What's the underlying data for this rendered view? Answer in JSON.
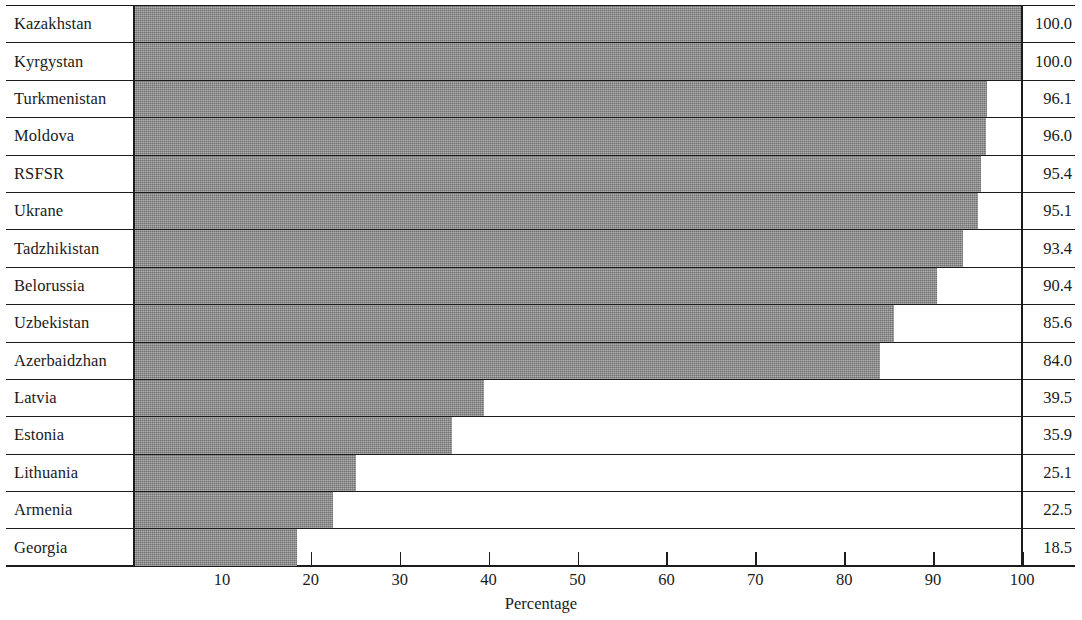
{
  "chart_data": {
    "type": "bar",
    "orientation": "horizontal",
    "title": "",
    "xlabel": "Percentage",
    "ylabel": "",
    "xlim": [
      0,
      105
    ],
    "xticks": [
      10,
      20,
      30,
      40,
      50,
      60,
      70,
      80,
      90,
      100
    ],
    "grid": false,
    "legend": null,
    "value_label_format": "one-decimal",
    "bar_color": "#8c8c8c",
    "axis_color": "#1c1c1c",
    "categories": [
      "Kazakhstan",
      "Kyrgystan",
      "Turkmenistan",
      "Moldova",
      "RSFSR",
      "Ukrane",
      "Tadzhikistan",
      "Belorussia",
      "Uzbekistan",
      "Azerbaidzhan",
      "Latvia",
      "Estonia",
      "Lithuania",
      "Armenia",
      "Georgia"
    ],
    "values": [
      100.0,
      100.0,
      96.1,
      96.0,
      95.4,
      95.1,
      93.4,
      90.4,
      85.6,
      84.0,
      39.5,
      35.9,
      25.1,
      22.5,
      18.5
    ],
    "value_labels": [
      "100.0",
      "100.0",
      "96.1",
      "96.0",
      "95.4",
      "95.1",
      "93.4",
      "90.4",
      "85.6",
      "84.0",
      "39.5",
      "35.9",
      "25.1",
      "22.5",
      "18.5"
    ]
  },
  "rows": [
    {
      "label": "Kazakhstan",
      "value": 100.0,
      "value_label": "100.0"
    },
    {
      "label": "Kyrgystan",
      "value": 100.0,
      "value_label": "100.0"
    },
    {
      "label": "Turkmenistan",
      "value": 96.1,
      "value_label": "96.1"
    },
    {
      "label": "Moldova",
      "value": 96.0,
      "value_label": "96.0"
    },
    {
      "label": "RSFSR",
      "value": 95.4,
      "value_label": "95.4"
    },
    {
      "label": "Ukrane",
      "value": 95.1,
      "value_label": "95.1"
    },
    {
      "label": "Tadzhikistan",
      "value": 93.4,
      "value_label": "93.4"
    },
    {
      "label": "Belorussia",
      "value": 90.4,
      "value_label": "90.4"
    },
    {
      "label": "Uzbekistan",
      "value": 85.6,
      "value_label": "85.6"
    },
    {
      "label": "Azerbaidzhan",
      "value": 84.0,
      "value_label": "84.0"
    },
    {
      "label": "Latvia",
      "value": 39.5,
      "value_label": "39.5"
    },
    {
      "label": "Estonia",
      "value": 35.9,
      "value_label": "35.9"
    },
    {
      "label": "Lithuania",
      "value": 25.1,
      "value_label": "25.1"
    },
    {
      "label": "Armenia",
      "value": 22.5,
      "value_label": "22.5"
    },
    {
      "label": "Georgia",
      "value": 18.5,
      "value_label": "18.5"
    }
  ],
  "axis": {
    "title": "Percentage",
    "ticks": [
      "10",
      "20",
      "30",
      "40",
      "50",
      "60",
      "70",
      "80",
      "90",
      "100"
    ],
    "tick_values": [
      10,
      20,
      30,
      40,
      50,
      60,
      70,
      80,
      90,
      100
    ]
  }
}
